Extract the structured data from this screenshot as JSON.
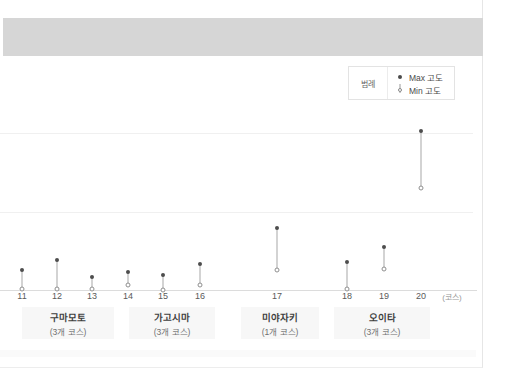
{
  "legend": {
    "title": "범례",
    "entries": [
      {
        "label": "Max 고도",
        "marker": "filled-dot"
      },
      {
        "label": "Min 고도",
        "marker": "hollow-dot"
      }
    ]
  },
  "chart_data": {
    "type": "scatter",
    "title": "",
    "xlabel": "(코스)",
    "ylabel": "",
    "grid": true,
    "legend_position": "top-right",
    "x": [
      11,
      12,
      13,
      14,
      15,
      16,
      17,
      18,
      19,
      20
    ],
    "tick_labels": [
      "11",
      "12",
      "13",
      "14",
      "15",
      "16",
      "17",
      "18",
      "19",
      "20"
    ],
    "unit_label": "(코스)",
    "series": [
      {
        "name": "Max 고도",
        "marker": "filled-dot",
        "values": [
          175,
          258,
          116,
          157,
          128,
          227,
          537,
          247,
          378,
          1384
        ]
      },
      {
        "name": "Min 고도",
        "marker": "hollow-dot",
        "values": [
          8,
          8,
          5,
          42,
          4,
          45,
          176,
          5,
          183,
          886
        ]
      }
    ],
    "groups": [
      {
        "name": "구마모토",
        "courses": "(3개 코스)",
        "from": 11,
        "to": 13
      },
      {
        "name": "가고시마",
        "courses": "(3개 코스)",
        "from": 14,
        "to": 16
      },
      {
        "name": "미야자키",
        "courses": "(1개 코스)",
        "from": 17,
        "to": 17
      },
      {
        "name": "오이타",
        "courses": "(3개 코스)",
        "from": 18,
        "to": 20
      }
    ]
  },
  "colors": {
    "banner": "#d6d6d6",
    "max_marker": "#4d4d4d",
    "min_marker": "#8f8f8f",
    "stem": "#a8a8a8",
    "grid": "#f0f0f0",
    "axis": "#dcdcdc",
    "group_box": "#f7f7f7"
  }
}
